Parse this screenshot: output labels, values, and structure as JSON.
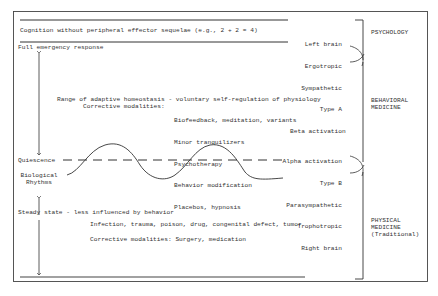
{
  "diagram": {
    "top": {
      "cognition_label": "Cognition without peripheral effector sequelae (e.g., 2 + 2 = 4)",
      "full_emergency": "Full emergency response"
    },
    "upper_right_traits": [
      "Left brain",
      "Ergotropic",
      "Sympathetic",
      "Type A",
      "Beta activation"
    ],
    "middle": {
      "range_label": "Range of adaptive homeostasis - voluntary self-regulation of physiology",
      "corrective_prefix": "Corrective modalities:",
      "corrective_items": [
        "Biofeedback, meditation, variants",
        "Minor tranquilizers",
        "Psychotherapy",
        "Behavior modification",
        "Placebos, hypnosis"
      ]
    },
    "left_labels": {
      "quiescence": "Quiescence",
      "biological_rhythms": "Biological\nRhythms",
      "steady_state": "Steady state - less influenced by behavior"
    },
    "lower_right_traits": [
      "Alpha activation",
      "Type B",
      "Parasympathetic",
      "Trophotropic",
      "Right brain"
    ],
    "bottom": {
      "causes": "Infection, trauma, poison, drug, congenital defect, tumor",
      "corrective": "Corrective modalities: Surgery, medication"
    },
    "categories": [
      {
        "label": "PSYCHOLOGY"
      },
      {
        "label": "BEHAVIORAL\nMEDICINE"
      },
      {
        "label": "PHYSICAL\nMEDICINE\n(Traditional)"
      }
    ]
  }
}
